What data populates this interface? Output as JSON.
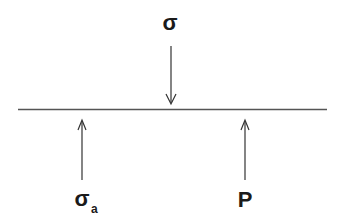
{
  "diagram": {
    "title": "",
    "labels": {
      "top": "σ",
      "bottom_left": "σ",
      "bottom_left_subscript": "a",
      "bottom_right": "P"
    },
    "elements": [
      {
        "id": "surface",
        "type": "line",
        "description": "horizontal surface"
      },
      {
        "id": "applied-stress",
        "type": "arrow",
        "direction": "down",
        "label": "σ"
      },
      {
        "id": "atmospheric-stress",
        "type": "arrow",
        "direction": "up",
        "label": "σa"
      },
      {
        "id": "pressure",
        "type": "arrow",
        "direction": "up",
        "label": "P"
      }
    ],
    "colors": {
      "line": "#555555",
      "arrow": "#333333",
      "text": "#1a1a1a"
    }
  }
}
